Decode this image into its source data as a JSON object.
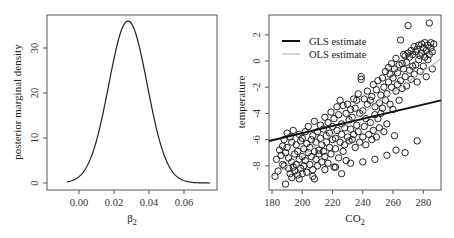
{
  "chart_data": [
    {
      "type": "line",
      "title": "",
      "xlabel": "β2",
      "ylabel": "posterior marginal density",
      "xlim": [
        -0.012,
        0.076
      ],
      "ylim": [
        -0.5,
        38
      ],
      "xticks": [
        0.0,
        0.02,
        0.04,
        0.06
      ],
      "xtick_labels": [
        "0.00",
        "0.02",
        "0.04",
        "0.06"
      ],
      "yticks": [
        0,
        10,
        20,
        30
      ],
      "ytick_labels": [
        "0",
        "10",
        "20",
        "30"
      ],
      "grid": false,
      "series": [
        {
          "name": "posterior density",
          "distribution": "normal",
          "mean": 0.028,
          "sd": 0.011,
          "peak": 36,
          "x_range": [
            -0.007,
            0.075
          ]
        }
      ]
    },
    {
      "type": "scatter",
      "title": "",
      "xlabel": "CO2",
      "ylabel": "temperature",
      "xlim": [
        178,
        292
      ],
      "ylim": [
        -9.8,
        3.5
      ],
      "xticks": [
        180,
        200,
        220,
        240,
        260,
        280
      ],
      "xtick_labels": [
        "180",
        "200",
        "220",
        "240",
        "260",
        "280"
      ],
      "yticks": [
        -8,
        -6,
        -4,
        -2,
        0,
        2
      ],
      "ytick_labels": [
        "-8",
        "-6",
        "-4",
        "-2",
        "0",
        "2"
      ],
      "grid": false,
      "legend": {
        "position": "top-left",
        "entries": [
          {
            "label": "GLS estimate",
            "color": "#111111",
            "style": "solid-thick"
          },
          {
            "label": "OLS estimate",
            "color": "#bbbbbb",
            "style": "solid-thin"
          }
        ]
      },
      "lines": [
        {
          "name": "GLS estimate",
          "x": [
            178,
            292
          ],
          "y": [
            -6.1,
            -3.0
          ]
        },
        {
          "name": "OLS estimate",
          "x": [
            178,
            292
          ],
          "y": [
            -9.0,
            0.2
          ]
        }
      ],
      "points": [
        [
          182,
          -8.8
        ],
        [
          183,
          -7.5
        ],
        [
          184,
          -8.4
        ],
        [
          185,
          -6.8
        ],
        [
          186,
          -7.2
        ],
        [
          187,
          -6.5
        ],
        [
          187,
          -7.9
        ],
        [
          188,
          -8.0
        ],
        [
          188,
          -6.0
        ],
        [
          189,
          -9.4
        ],
        [
          189,
          -7.0
        ],
        [
          190,
          -5.5
        ],
        [
          190,
          -6.6
        ],
        [
          191,
          -7.4
        ],
        [
          191,
          -8.2
        ],
        [
          192,
          -5.8
        ],
        [
          192,
          -8.6
        ],
        [
          193,
          -6.2
        ],
        [
          193,
          -7.7
        ],
        [
          194,
          -8.1
        ],
        [
          194,
          -5.3
        ],
        [
          195,
          -7.1
        ],
        [
          195,
          -8.4
        ],
        [
          196,
          -6.4
        ],
        [
          196,
          -7.9
        ],
        [
          197,
          -8.7
        ],
        [
          197,
          -6.9
        ],
        [
          198,
          -5.6
        ],
        [
          198,
          -7.5
        ],
        [
          199,
          -8.2
        ],
        [
          199,
          -6.1
        ],
        [
          200,
          -7.3
        ],
        [
          200,
          -5.9
        ],
        [
          201,
          -8.0
        ],
        [
          201,
          -6.7
        ],
        [
          202,
          -7.6
        ],
        [
          202,
          -5.4
        ],
        [
          203,
          -6.3
        ],
        [
          203,
          -8.5
        ],
        [
          204,
          -7.0
        ],
        [
          204,
          -5.0
        ],
        [
          205,
          -6.6
        ],
        [
          205,
          -7.9
        ],
        [
          206,
          -6.0
        ],
        [
          206,
          -7.3
        ],
        [
          207,
          -5.7
        ],
        [
          207,
          -8.3
        ],
        [
          208,
          -6.9
        ],
        [
          208,
          -4.6
        ],
        [
          209,
          -7.5
        ],
        [
          209,
          -6.2
        ],
        [
          210,
          -5.4
        ],
        [
          210,
          -8.0
        ],
        [
          211,
          -6.8
        ],
        [
          211,
          -7.1
        ],
        [
          212,
          -5.9
        ],
        [
          212,
          -4.9
        ],
        [
          213,
          -6.4
        ],
        [
          213,
          -7.7
        ],
        [
          214,
          -5.2
        ],
        [
          214,
          -6.9
        ],
        [
          215,
          -4.3
        ],
        [
          215,
          -7.3
        ],
        [
          216,
          -5.7
        ],
        [
          216,
          -6.2
        ],
        [
          217,
          -4.7
        ],
        [
          217,
          -7.8
        ],
        [
          218,
          -5.5
        ],
        [
          218,
          -6.6
        ],
        [
          219,
          -3.9
        ],
        [
          219,
          -7.1
        ],
        [
          220,
          -5.0
        ],
        [
          220,
          -6.0
        ],
        [
          221,
          -4.4
        ],
        [
          221,
          -8.1
        ],
        [
          222,
          -5.9
        ],
        [
          222,
          -6.7
        ],
        [
          223,
          -3.5
        ],
        [
          223,
          -5.3
        ],
        [
          224,
          -7.4
        ],
        [
          224,
          -4.1
        ],
        [
          225,
          -6.2
        ],
        [
          225,
          -3.0
        ],
        [
          226,
          -5.6
        ],
        [
          226,
          -4.8
        ],
        [
          227,
          -6.9
        ],
        [
          227,
          -3.4
        ],
        [
          228,
          -5.1
        ],
        [
          228,
          -6.4
        ],
        [
          229,
          -4.0
        ],
        [
          229,
          -7.6
        ],
        [
          230,
          -3.3
        ],
        [
          230,
          -5.8
        ],
        [
          231,
          -4.5
        ],
        [
          231,
          -6.1
        ],
        [
          232,
          -3.7
        ],
        [
          232,
          -5.2
        ],
        [
          233,
          -6.0
        ],
        [
          233,
          -4.3
        ],
        [
          234,
          -2.9
        ],
        [
          234,
          -5.6
        ],
        [
          235,
          -3.6
        ],
        [
          235,
          -6.6
        ],
        [
          236,
          -4.9
        ],
        [
          236,
          -3.0
        ],
        [
          237,
          -5.4
        ],
        [
          237,
          -2.5
        ],
        [
          238,
          -6.2
        ],
        [
          238,
          -4.0
        ],
        [
          239,
          -1.4
        ],
        [
          239,
          -1.2
        ],
        [
          240,
          -5.8
        ],
        [
          240,
          -3.8
        ],
        [
          241,
          -2.9
        ],
        [
          241,
          -5.0
        ],
        [
          242,
          -4.4
        ],
        [
          242,
          -6.4
        ],
        [
          243,
          -3.3
        ],
        [
          243,
          -2.3
        ],
        [
          244,
          -5.6
        ],
        [
          245,
          -4.7
        ],
        [
          245,
          -3.0
        ],
        [
          246,
          -6.0
        ],
        [
          246,
          -2.7
        ],
        [
          247,
          -5.3
        ],
        [
          247,
          -1.8
        ],
        [
          248,
          -4.1
        ],
        [
          248,
          -3.5
        ],
        [
          249,
          -5.8
        ],
        [
          249,
          -2.2
        ],
        [
          250,
          -4.4
        ],
        [
          250,
          -1.5
        ],
        [
          251,
          -3.2
        ],
        [
          251,
          -5.1
        ],
        [
          252,
          -2.6
        ],
        [
          252,
          -4.0
        ],
        [
          253,
          -1.3
        ],
        [
          253,
          -3.6
        ],
        [
          254,
          -5.4
        ],
        [
          254,
          -2.0
        ],
        [
          255,
          -3.0
        ],
        [
          255,
          -0.8
        ],
        [
          256,
          -2.5
        ],
        [
          256,
          -4.8
        ],
        [
          257,
          -1.6
        ],
        [
          257,
          -0.5
        ],
        [
          258,
          -3.3
        ],
        [
          258,
          -1.0
        ],
        [
          259,
          -2.0
        ],
        [
          259,
          -0.2
        ],
        [
          260,
          -3.7
        ],
        [
          260,
          -1.3
        ],
        [
          261,
          -0.6
        ],
        [
          261,
          -5.7
        ],
        [
          262,
          -2.3
        ],
        [
          262,
          0.2
        ],
        [
          263,
          -1.8
        ],
        [
          263,
          -0.9
        ],
        [
          264,
          -3.0
        ],
        [
          264,
          -0.3
        ],
        [
          265,
          1.6
        ],
        [
          265,
          -1.5
        ],
        [
          266,
          -0.2
        ],
        [
          266,
          -2.1
        ],
        [
          267,
          0.5
        ],
        [
          267,
          -0.6
        ],
        [
          268,
          -1.2
        ],
        [
          268,
          0.4
        ],
        [
          269,
          -0.1
        ],
        [
          269,
          -1.9
        ],
        [
          270,
          0.6
        ],
        [
          270,
          2.7
        ],
        [
          271,
          -0.7
        ],
        [
          271,
          0.3
        ],
        [
          272,
          -1.4
        ],
        [
          272,
          0.8
        ],
        [
          273,
          -0.4
        ],
        [
          273,
          0.5
        ],
        [
          274,
          1.1
        ],
        [
          274,
          -1.0
        ],
        [
          275,
          0.7
        ],
        [
          275,
          -0.3
        ],
        [
          276,
          0.9
        ],
        [
          276,
          -1.6
        ],
        [
          277,
          1.2
        ],
        [
          277,
          0.1
        ],
        [
          278,
          0.4
        ],
        [
          278,
          -0.8
        ],
        [
          279,
          1.3
        ],
        [
          279,
          0.6
        ],
        [
          280,
          -0.4
        ],
        [
          280,
          1.0
        ],
        [
          281,
          0.3
        ],
        [
          281,
          1.4
        ],
        [
          282,
          0.8
        ],
        [
          282,
          -1.2
        ],
        [
          283,
          1.2
        ],
        [
          283,
          0.1
        ],
        [
          284,
          2.9
        ],
        [
          284,
          0.5
        ],
        [
          285,
          1.0
        ],
        [
          285,
          1.4
        ],
        [
          286,
          0.7
        ],
        [
          286,
          -0.6
        ],
        [
          287,
          1.3
        ],
        [
          198,
          -9.0
        ],
        [
          200,
          -8.6
        ],
        [
          193,
          -8.9
        ],
        [
          207,
          -8.8
        ],
        [
          215,
          -8.3
        ],
        [
          222,
          -8.1
        ],
        [
          232,
          -7.8
        ],
        [
          240,
          -7.7
        ],
        [
          248,
          -7.5
        ],
        [
          256,
          -7.2
        ],
        [
          262,
          -6.8
        ],
        [
          268,
          -7.0
        ],
        [
          276,
          -6.1
        ],
        [
          208,
          -9.0
        ],
        [
          226,
          -8.6
        ]
      ]
    }
  ]
}
